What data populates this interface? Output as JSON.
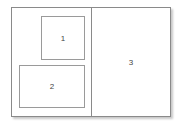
{
  "diagram": {
    "type": "page-layout",
    "regions": [
      {
        "id": "1",
        "label": "1"
      },
      {
        "id": "2",
        "label": "2"
      },
      {
        "id": "3",
        "label": "3"
      }
    ]
  }
}
